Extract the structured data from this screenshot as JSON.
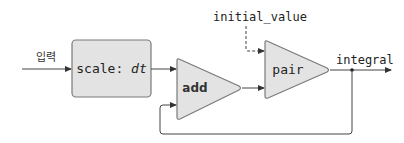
{
  "diagram": {
    "type": "block-diagram",
    "input_label": "입력",
    "output_label": "integral",
    "initial_value_label": "initial_value",
    "blocks": {
      "scale": {
        "label": "scale: ",
        "param": "dt",
        "shape": "rounded-rect"
      },
      "add": {
        "label": "add",
        "shape": "triangle"
      },
      "pair": {
        "label": "pair",
        "shape": "triangle"
      }
    },
    "connections": [
      {
        "from": "input",
        "to": "scale",
        "style": "solid"
      },
      {
        "from": "scale",
        "to": "add",
        "style": "solid"
      },
      {
        "from": "add",
        "to": "pair",
        "style": "solid"
      },
      {
        "from": "initial_value",
        "to": "pair",
        "style": "dashed"
      },
      {
        "from": "pair",
        "to": "output",
        "style": "solid"
      },
      {
        "from": "pair",
        "to": "add",
        "style": "solid",
        "note": "feedback"
      }
    ],
    "colors": {
      "block_fill": "#e3e3e3",
      "block_stroke": "#7a7a7a",
      "wire": "#444444",
      "text": "#222222"
    }
  }
}
